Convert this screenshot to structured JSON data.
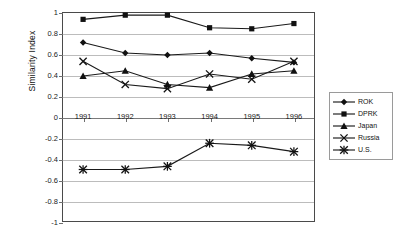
{
  "chart_data": {
    "type": "line",
    "title": "",
    "xlabel": "",
    "ylabel": "Similarity Index",
    "categories": [
      "1991",
      "1992",
      "1993",
      "1994",
      "1995",
      "1996"
    ],
    "ylim": [
      -1,
      1
    ],
    "yticks": [
      1,
      0.8,
      0.6,
      0.4,
      0.2,
      0,
      -0.2,
      -0.4,
      -0.6,
      -0.8,
      -1
    ],
    "ytick_labels": [
      "1",
      "0.8",
      "0.6",
      "0.4",
      "0.2",
      "0",
      "-0.2",
      "-0.4",
      "-0.6",
      "-0.8",
      "-1"
    ],
    "grid": true,
    "legend_position": "right",
    "series": [
      {
        "name": "ROK",
        "marker": "diamond",
        "values": [
          0.71,
          0.61,
          0.59,
          0.61,
          0.56,
          0.52
        ]
      },
      {
        "name": "DPRK",
        "marker": "square",
        "values": [
          0.93,
          0.97,
          0.97,
          0.85,
          0.84,
          0.89
        ]
      },
      {
        "name": "Japan",
        "marker": "triangle",
        "values": [
          0.39,
          0.44,
          0.31,
          0.28,
          0.41,
          0.44
        ]
      },
      {
        "name": "Russia",
        "marker": "cross",
        "values": [
          0.53,
          0.31,
          0.27,
          0.41,
          0.36,
          0.53
        ]
      },
      {
        "name": "U.S.",
        "marker": "asterisk",
        "values": [
          -0.5,
          -0.5,
          -0.47,
          -0.25,
          -0.27,
          -0.33
        ]
      }
    ]
  },
  "axis": {
    "y_title": "Similarity Index"
  },
  "legend": {
    "entries": [
      "ROK",
      "DPRK",
      "Japan",
      "Russia",
      "U.S."
    ]
  },
  "caption": {
    "text": ""
  }
}
